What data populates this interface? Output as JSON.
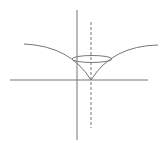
{
  "diagram": {
    "type": "geometric-figure",
    "stroke_color": "#777777",
    "background": "#ffffff",
    "axes": {
      "horizontal": {
        "x1": 10,
        "y1": 80,
        "x2": 148,
        "y2": 80
      },
      "vertical": {
        "x1": 77,
        "y1": 10,
        "x2": 77,
        "y2": 140
      }
    },
    "symmetry_axis": {
      "style": "dashed",
      "x1": 91,
      "y1": 22,
      "x2": 91,
      "y2": 128
    },
    "cusp": {
      "x": 91,
      "y": 80
    },
    "left_curve": {
      "start": {
        "x": 24,
        "y": 44
      },
      "control": {
        "x": 70,
        "y": 46
      },
      "end": {
        "x": 91,
        "y": 80
      }
    },
    "right_curve": {
      "start": {
        "x": 158,
        "y": 45
      },
      "control": {
        "x": 112,
        "y": 46
      },
      "end": {
        "x": 91,
        "y": 80
      }
    },
    "ellipse": {
      "cx": 92,
      "cy": 59,
      "rx": 20,
      "ry": 3.5
    }
  }
}
